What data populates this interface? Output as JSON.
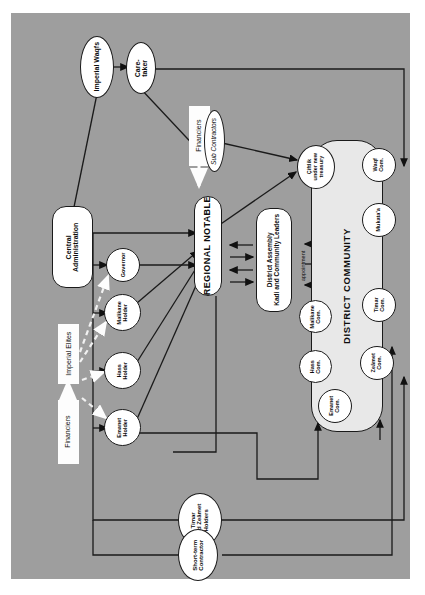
{
  "diagram": {
    "panel_color": "#9e9e9e",
    "node_fill": "#ffffff",
    "district_fill": "#e8e8e8",
    "line_color": "#1a1a1a",
    "white_arrow_color": "#ffffff"
  },
  "nodes": {
    "imperial_waqfs": "Imperial Waqfs",
    "caretaker": "Care-\ntaker",
    "central_administration": "Central\nAdministration",
    "financiers_top": "Financiers",
    "financiers_bottom": "Financiers",
    "imperial_elites": "Imperial Elites",
    "sub_contractors": "Sub Contractors",
    "regional_notable": "REGIONAL NOTABLE",
    "district_assembly": "District Assembly\nKadi and Community Leaders",
    "governor": "Governor",
    "malikane_holder": "Malikane\nHolder",
    "hass_holder": "Hass\nHolder",
    "emanet_holder": "Emanet\nHolder",
    "timar_zeamet_holders": "Timar\nand Zeâmet\nHolders",
    "short_term_contractor": "Short-term\nContractor",
    "ciftlik_new_treasury": "Çiftlik\nunder new\ntreasury",
    "district_community": "DISTRICT COMMUNITY",
    "malikane_com": "Malikane\nCom.",
    "hass_com": "Hass\nCom.",
    "emanet_com": "Emanet\nCom.",
    "waqf_com": "Waqf\nCom.",
    "mukataa": "Mukata'a",
    "timar_com": "Timar\nCom.",
    "zeamet_com": "Zeâmet\nCom."
  },
  "edge_labels": {
    "appointment": "appointment"
  }
}
